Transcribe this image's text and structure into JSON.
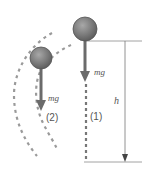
{
  "diagram": {
    "labels": {
      "force_1": "mg",
      "force_2": "mg",
      "path_1": "(1)",
      "path_2": "(2)",
      "height": "h"
    },
    "colors": {
      "ball_fill": "#7a7a7a",
      "ball_stroke": "#555555",
      "arrow": "#6b6b6b",
      "dashed": "#9a9a9a",
      "guide": "#8a8a8a"
    },
    "objects": [
      {
        "id": "ball-1",
        "path": "(1)",
        "description": "ball falling straight down"
      },
      {
        "id": "ball-2",
        "path": "(2)",
        "description": "ball on curved path"
      }
    ]
  }
}
